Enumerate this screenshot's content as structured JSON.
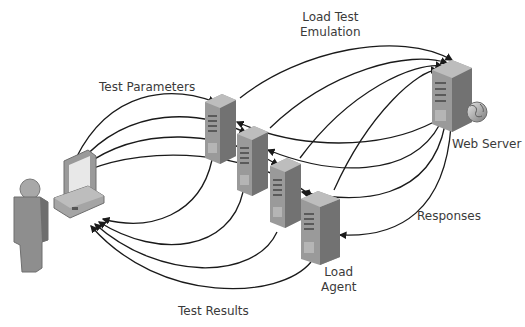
{
  "diagram": {
    "labels": {
      "test_parameters": "Test Parameters",
      "load_test_emulation_line1": "Load Test",
      "load_test_emulation_line2": "Emulation",
      "web_server": "Web Server",
      "responses": "Responses",
      "load_agent_line1": "Load",
      "load_agent_line2": "Agent",
      "test_results": "Test Results"
    },
    "nodes": [
      {
        "id": "user",
        "type": "person-icon"
      },
      {
        "id": "client",
        "type": "desktop-computer-icon"
      },
      {
        "id": "agent1",
        "type": "server-icon"
      },
      {
        "id": "agent2",
        "type": "server-icon"
      },
      {
        "id": "agent3",
        "type": "server-icon"
      },
      {
        "id": "agent4",
        "type": "server-icon",
        "label": "Load Agent"
      },
      {
        "id": "webserver",
        "type": "server-globe-icon",
        "label": "Web Server"
      }
    ],
    "edges": [
      {
        "from": "client",
        "to": "agents",
        "label": "Test Parameters",
        "count": 4
      },
      {
        "from": "agents",
        "to": "webserver",
        "label": "Load Test Emulation",
        "count": 4
      },
      {
        "from": "webserver",
        "to": "agents",
        "label": "Responses",
        "count": 4
      },
      {
        "from": "agents",
        "to": "client",
        "label": "Test Results",
        "count": 4
      }
    ],
    "colors": {
      "line": "#1a1a1a",
      "server_front": "#9a9a9a",
      "server_side": "#6e6e6e",
      "server_top": "#b8b8b8",
      "text": "#3a3a3a"
    }
  }
}
